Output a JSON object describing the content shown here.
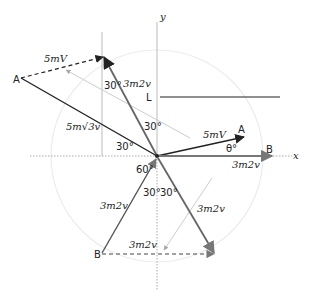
{
  "diagram": {
    "axes": {
      "x_label": "x",
      "y_label": "y"
    },
    "points": {
      "A_left": "A",
      "A_right": "A",
      "B_right": "B",
      "B_bottom": "B",
      "L": "L"
    },
    "vectors": {
      "dashed_top": "5mV",
      "upper_arrow": "3m2v",
      "long_left": "5m√3v",
      "right_A": "5mV",
      "right_B": "3m2v",
      "lower_left": "3m2v",
      "lower_right": "3m2v",
      "dashed_bottom": "3m2v"
    },
    "angles": {
      "top_vertical": "30°",
      "upper_near_origin": "30°",
      "left_horizontal": "30°",
      "theta": "θ°",
      "lower_60": "60°",
      "lower_30_left": "30°",
      "lower_30_right": "30°"
    },
    "colors": {
      "dark_line": "#222222",
      "gray_arrow": "#777777",
      "light_line": "#cccccc",
      "circle": "#e8e8e8"
    }
  }
}
